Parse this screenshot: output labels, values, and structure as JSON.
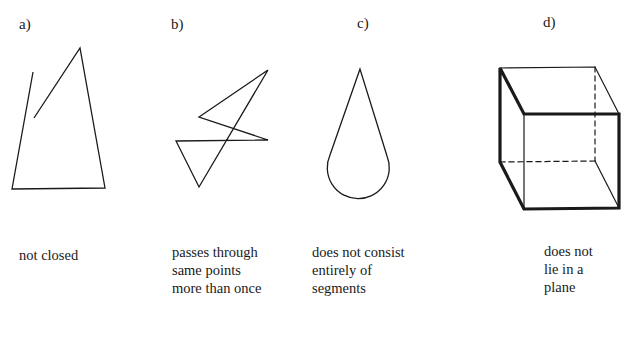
{
  "figures": [
    {
      "label": "a)",
      "caption": [
        "not closed"
      ]
    },
    {
      "label": "b)",
      "caption": [
        "passes through",
        "same points",
        "more than once"
      ]
    },
    {
      "label": "c)",
      "caption": [
        "does not consist",
        "entirely of",
        "segments"
      ]
    },
    {
      "label": "d)",
      "caption": [
        "does not",
        "lie in a",
        "plane"
      ]
    }
  ],
  "colors": {
    "stroke": "#1a1a1a",
    "background": "#ffffff"
  }
}
